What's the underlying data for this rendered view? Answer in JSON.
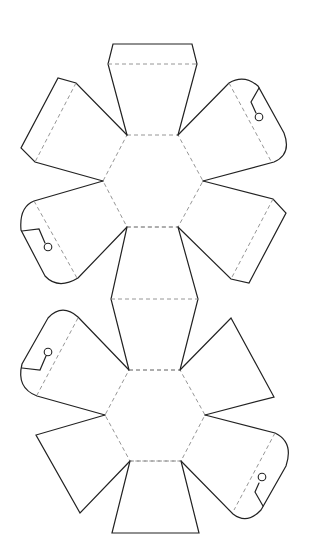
{
  "diagram": {
    "title": "",
    "type": "papercraft-net",
    "colors": {
      "background": "#ffffff",
      "cut_line": "#222222",
      "fold_line": "#8a8a8a"
    },
    "components": [
      {
        "name": "top-hexagon",
        "kind": "hexagon-face"
      },
      {
        "name": "bottom-hexagon",
        "kind": "hexagon-face"
      },
      {
        "name": "top-flap",
        "kind": "trapezoid-flap-with-tuck"
      },
      {
        "name": "connector-band",
        "kind": "double-trapezoid"
      },
      {
        "name": "bottom-flap",
        "kind": "trapezoid-flap"
      },
      {
        "name": "upper-left-tuck-flap",
        "kind": "pentagon-flap-with-tuck"
      },
      {
        "name": "upper-right-slot-flap",
        "kind": "rounded-flap-with-keyhole-slot"
      },
      {
        "name": "mid-left-slot-flap",
        "kind": "rounded-flap-with-keyhole-slot"
      },
      {
        "name": "mid-right-tuck-flap",
        "kind": "pentagon-flap-with-tuck"
      },
      {
        "name": "lower-left-slot-flap",
        "kind": "rounded-flap-with-keyhole-slot"
      },
      {
        "name": "lower-right-triangle-flap",
        "kind": "triangle-flap"
      },
      {
        "name": "bottom-left-triangle-flap",
        "kind": "triangle-flap"
      },
      {
        "name": "bottom-right-slot-flap",
        "kind": "rounded-flap-with-keyhole-slot"
      }
    ],
    "legend": {
      "solid_line": "cut",
      "dashed_line": "fold"
    }
  }
}
